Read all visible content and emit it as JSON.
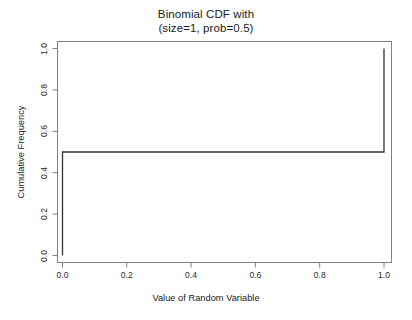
{
  "chart_data": {
    "type": "line",
    "subtype": "step-cdf",
    "title": "Binomial CDF with",
    "title_line2": "(size=1, prob=0.5)",
    "title_lines": [
      "Binomial CDF with",
      "(size=1, prob=0.5)"
    ],
    "xlabel": "Value of Random Variable",
    "ylabel": "Cumulative Frequency",
    "xlim": [
      -0.04,
      1.04
    ],
    "ylim": [
      -0.04,
      1.04
    ],
    "xticks": [
      0.0,
      0.2,
      0.4,
      0.6,
      0.8,
      1.0
    ],
    "xticklabels": [
      "0.0",
      "0.2",
      "0.4",
      "0.6",
      "0.8",
      "1.0"
    ],
    "yticks": [
      0.0,
      0.2,
      0.4,
      0.6,
      0.8,
      1.0
    ],
    "yticklabels": [
      "0.0",
      "0.2",
      "0.4",
      "0.6",
      "0.8",
      "1.0"
    ],
    "grid": false,
    "legend": false,
    "frame": true,
    "line_color": "#333333",
    "line_width": 1.3,
    "background": "#ffffff",
    "x": [
      0.0,
      0.0,
      1.0,
      1.0
    ],
    "y": [
      0.0,
      0.5,
      0.5,
      1.0
    ],
    "series": [
      {
        "name": "Cumulative frequency",
        "points": [
          {
            "x": 0.0,
            "y": 0.0
          },
          {
            "x": 0.0,
            "y": 0.5
          },
          {
            "x": 1.0,
            "y": 0.5
          },
          {
            "x": 1.0,
            "y": 1.0
          }
        ]
      }
    ],
    "steps": [
      {
        "value": 0,
        "cumulative": 0.5
      },
      {
        "value": 1,
        "cumulative": 1.0
      }
    ],
    "annotations": []
  }
}
